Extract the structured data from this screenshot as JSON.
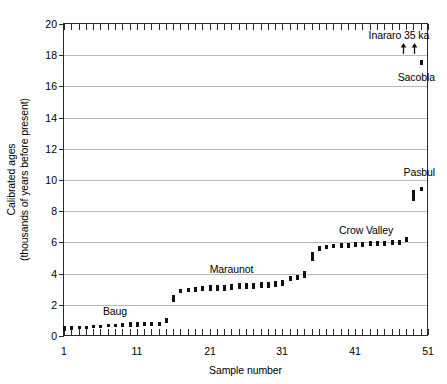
{
  "chart_data": {
    "type": "scatter",
    "title": "",
    "xlabel": "Sample number",
    "ylabel": "Calibrated ages",
    "ylabel_line1": "Calibrated ages",
    "ylabel_line2": "(thousands of years before present)",
    "xlim": [
      1,
      51
    ],
    "ylim": [
      0,
      20
    ],
    "xticks": [
      1,
      11,
      21,
      31,
      41,
      51
    ],
    "xtick_labels": [
      "1",
      "11",
      "21",
      "31",
      "41",
      "51"
    ],
    "x_minor_tick_step": 1,
    "yticks": [
      0,
      2,
      4,
      6,
      8,
      10,
      12,
      14,
      16,
      18,
      20
    ],
    "ytick_labels": [
      "0",
      "2",
      "4",
      "6",
      "8",
      "10",
      "12",
      "14",
      "16",
      "18",
      "20"
    ],
    "grid": "horizontal",
    "grid_color": "#b9b9b9",
    "marker_color": "#111111",
    "legend": "none",
    "points": [
      {
        "x": 1,
        "y": 0.5,
        "h": 0.3
      },
      {
        "x": 2,
        "y": 0.52,
        "h": 0.26
      },
      {
        "x": 3,
        "y": 0.53,
        "h": 0.22
      },
      {
        "x": 4,
        "y": 0.55,
        "h": 0.22
      },
      {
        "x": 5,
        "y": 0.58,
        "h": 0.22
      },
      {
        "x": 6,
        "y": 0.62,
        "h": 0.22
      },
      {
        "x": 7,
        "y": 0.66,
        "h": 0.22
      },
      {
        "x": 8,
        "y": 0.68,
        "h": 0.22
      },
      {
        "x": 9,
        "y": 0.7,
        "h": 0.26
      },
      {
        "x": 10,
        "y": 0.72,
        "h": 0.3
      },
      {
        "x": 11,
        "y": 0.74,
        "h": 0.3
      },
      {
        "x": 12,
        "y": 0.74,
        "h": 0.26
      },
      {
        "x": 13,
        "y": 0.76,
        "h": 0.26
      },
      {
        "x": 14,
        "y": 0.78,
        "h": 0.26
      },
      {
        "x": 15,
        "y": 0.98,
        "h": 0.34
      },
      {
        "x": 16,
        "y": 2.42,
        "h": 0.42
      },
      {
        "x": 17,
        "y": 2.86,
        "h": 0.26
      },
      {
        "x": 18,
        "y": 2.92,
        "h": 0.26
      },
      {
        "x": 19,
        "y": 2.98,
        "h": 0.3
      },
      {
        "x": 20,
        "y": 3.04,
        "h": 0.34
      },
      {
        "x": 21,
        "y": 3.06,
        "h": 0.38
      },
      {
        "x": 22,
        "y": 3.08,
        "h": 0.38
      },
      {
        "x": 23,
        "y": 3.1,
        "h": 0.38
      },
      {
        "x": 24,
        "y": 3.14,
        "h": 0.38
      },
      {
        "x": 25,
        "y": 3.18,
        "h": 0.38
      },
      {
        "x": 26,
        "y": 3.2,
        "h": 0.38
      },
      {
        "x": 27,
        "y": 3.22,
        "h": 0.38
      },
      {
        "x": 28,
        "y": 3.24,
        "h": 0.38
      },
      {
        "x": 29,
        "y": 3.28,
        "h": 0.38
      },
      {
        "x": 30,
        "y": 3.32,
        "h": 0.38
      },
      {
        "x": 31,
        "y": 3.4,
        "h": 0.38
      },
      {
        "x": 32,
        "y": 3.66,
        "h": 0.34
      },
      {
        "x": 33,
        "y": 3.72,
        "h": 0.34
      },
      {
        "x": 34,
        "y": 3.94,
        "h": 0.42
      },
      {
        "x": 35,
        "y": 5.12,
        "h": 0.6
      },
      {
        "x": 36,
        "y": 5.62,
        "h": 0.3
      },
      {
        "x": 37,
        "y": 5.72,
        "h": 0.26
      },
      {
        "x": 38,
        "y": 5.76,
        "h": 0.26
      },
      {
        "x": 39,
        "y": 5.8,
        "h": 0.3
      },
      {
        "x": 40,
        "y": 5.82,
        "h": 0.34
      },
      {
        "x": 41,
        "y": 5.84,
        "h": 0.34
      },
      {
        "x": 42,
        "y": 5.88,
        "h": 0.34
      },
      {
        "x": 43,
        "y": 5.92,
        "h": 0.3
      },
      {
        "x": 44,
        "y": 5.94,
        "h": 0.3
      },
      {
        "x": 45,
        "y": 5.96,
        "h": 0.3
      },
      {
        "x": 46,
        "y": 5.98,
        "h": 0.3
      },
      {
        "x": 47,
        "y": 6.02,
        "h": 0.3
      },
      {
        "x": 48,
        "y": 6.18,
        "h": 0.3
      },
      {
        "x": 49,
        "y": 9.0,
        "h": 0.7
      },
      {
        "x": 50,
        "y": 9.42,
        "h": 0.26
      },
      {
        "x": 50,
        "y": 17.52,
        "h": 0.34
      }
    ],
    "annotations": [
      {
        "id": "baug",
        "text": "Baug",
        "x": 8.0,
        "y": 1.55,
        "anchor": "middle"
      },
      {
        "id": "maraunot",
        "text": "Maraunot",
        "x": 24.0,
        "y": 4.2,
        "anchor": "middle"
      },
      {
        "id": "crow-valley",
        "text": "Crow Valley",
        "x": 42.5,
        "y": 6.72,
        "anchor": "middle"
      },
      {
        "id": "pasbul",
        "text": "Pasbul",
        "x": 49.8,
        "y": 10.45,
        "anchor": "middle"
      },
      {
        "id": "sacobla",
        "text": "Sacobla",
        "x": 49.4,
        "y": 16.55,
        "anchor": "middle"
      },
      {
        "id": "inararo-35ka",
        "text": "Inararo 35 ka",
        "x": 47.0,
        "y": 19.2,
        "anchor": "middle"
      }
    ],
    "arrows": [
      {
        "id": "inararo-arrow-left",
        "x": 47.7,
        "y_tail": 18.25,
        "y_head": 18.95,
        "direction": "up"
      },
      {
        "id": "inararo-arrow-right",
        "x": 49.1,
        "y_tail": 18.25,
        "y_head": 18.95,
        "direction": "up"
      }
    ]
  }
}
